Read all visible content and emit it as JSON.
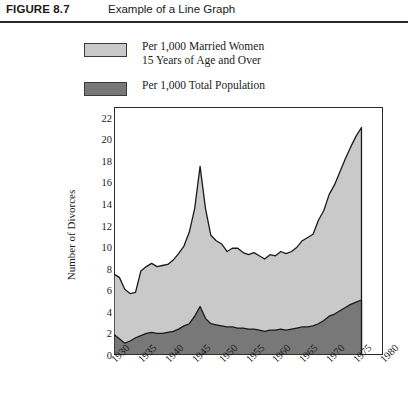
{
  "header": {
    "figure_number": "FIGURE 8.7",
    "caption": "Example of a Line Graph"
  },
  "legend": {
    "items": [
      {
        "label_line1": "Per 1,000 Married Women",
        "label_line2": "15 Years of Age and Over",
        "color": "#c9c9c9",
        "swatch_name": "legend-swatch-married-women"
      },
      {
        "label_line1": "Per 1,000 Total Population",
        "label_line2": "",
        "color": "#787878",
        "swatch_name": "legend-swatch-total-population"
      }
    ]
  },
  "chart_data": {
    "type": "area",
    "title": "Example of a Line Graph",
    "xlabel": "",
    "ylabel": "Number of Divorces",
    "xlim": [
      1930,
      1980
    ],
    "ylim": [
      0,
      23
    ],
    "yticks": [
      0,
      2,
      4,
      6,
      8,
      10,
      12,
      14,
      16,
      18,
      20,
      22
    ],
    "xticks": [
      1930,
      1935,
      1940,
      1945,
      1950,
      1955,
      1960,
      1965,
      1970,
      1975,
      1980
    ],
    "grid": false,
    "legend_position": "above-plot",
    "data_end_year": 1976,
    "colors": {
      "married_women_fill": "#c9c9c9",
      "total_population_fill": "#787878",
      "line": "#1a1a1a",
      "frame": "#2a2a2a"
    },
    "x": [
      1930,
      1931,
      1932,
      1933,
      1934,
      1935,
      1936,
      1937,
      1938,
      1939,
      1940,
      1941,
      1942,
      1943,
      1944,
      1945,
      1946,
      1947,
      1948,
      1949,
      1950,
      1951,
      1952,
      1953,
      1954,
      1955,
      1956,
      1957,
      1958,
      1959,
      1960,
      1961,
      1962,
      1963,
      1964,
      1965,
      1966,
      1967,
      1968,
      1969,
      1970,
      1971,
      1972,
      1973,
      1974,
      1975,
      1976
    ],
    "series": [
      {
        "name": "Per 1,000 Married Women 15 Years of Age and Over",
        "color": "#c9c9c9",
        "values": [
          7.5,
          7.2,
          6.1,
          5.7,
          5.8,
          7.8,
          8.2,
          8.5,
          8.2,
          8.3,
          8.4,
          8.8,
          9.4,
          10.1,
          11.4,
          13.6,
          17.5,
          13.6,
          11.1,
          10.6,
          10.3,
          9.6,
          9.9,
          9.9,
          9.5,
          9.3,
          9.5,
          9.2,
          8.9,
          9.3,
          9.2,
          9.6,
          9.4,
          9.6,
          10.0,
          10.6,
          10.9,
          11.2,
          12.5,
          13.4,
          14.9,
          15.8,
          17.0,
          18.2,
          19.3,
          20.3,
          21.1
        ]
      },
      {
        "name": "Per 1,000 Total Population",
        "color": "#787878",
        "values": [
          1.9,
          1.5,
          1.1,
          1.3,
          1.6,
          1.8,
          2.0,
          2.1,
          2.0,
          2.0,
          2.1,
          2.2,
          2.4,
          2.7,
          2.9,
          3.6,
          4.5,
          3.4,
          2.9,
          2.8,
          2.7,
          2.6,
          2.6,
          2.5,
          2.5,
          2.4,
          2.4,
          2.3,
          2.2,
          2.3,
          2.3,
          2.4,
          2.3,
          2.4,
          2.5,
          2.6,
          2.6,
          2.7,
          2.9,
          3.2,
          3.6,
          3.8,
          4.1,
          4.4,
          4.7,
          4.9,
          5.1
        ]
      }
    ]
  }
}
